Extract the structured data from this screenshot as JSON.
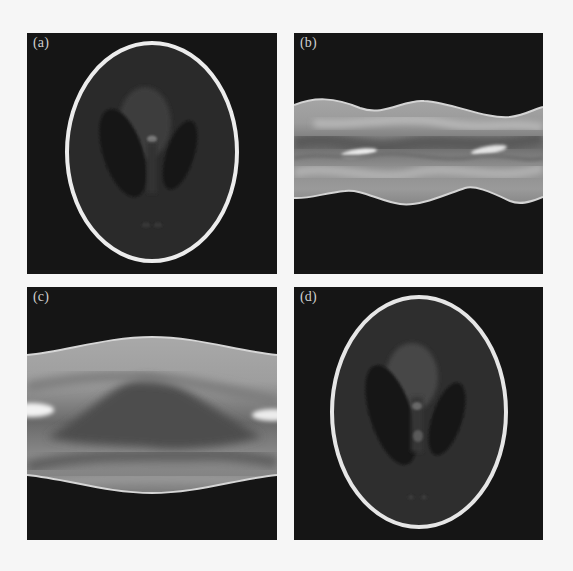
{
  "figure": {
    "background_color": "#f6f6f6",
    "panel_background_color": "#151515",
    "panels": [
      {
        "id": "a",
        "label": "(a)",
        "content": "phantom-image",
        "description": "Shepp-Logan head phantom (original)"
      },
      {
        "id": "b",
        "label": "(b)",
        "content": "sinogram",
        "description": "Sinogram / projection data with wavy band"
      },
      {
        "id": "c",
        "label": "(c)",
        "content": "sinogram",
        "description": "Sinogram / projection data with broad band"
      },
      {
        "id": "d",
        "label": "(d)",
        "content": "phantom-image",
        "description": "Reconstructed Shepp-Logan head phantom"
      }
    ],
    "colors": {
      "skull_ring": "#e8e8e8",
      "brain_tissue": "#2c2c2c",
      "ventricle_dark": "#141414",
      "central_blob": "#454545",
      "bright_spot": "#8a8a8a",
      "band_edge": "#d8d8d8",
      "band_fill_light": "#bdbdbd",
      "band_fill_mid": "#8f8f8f",
      "band_fill_dark": "#555555"
    }
  }
}
